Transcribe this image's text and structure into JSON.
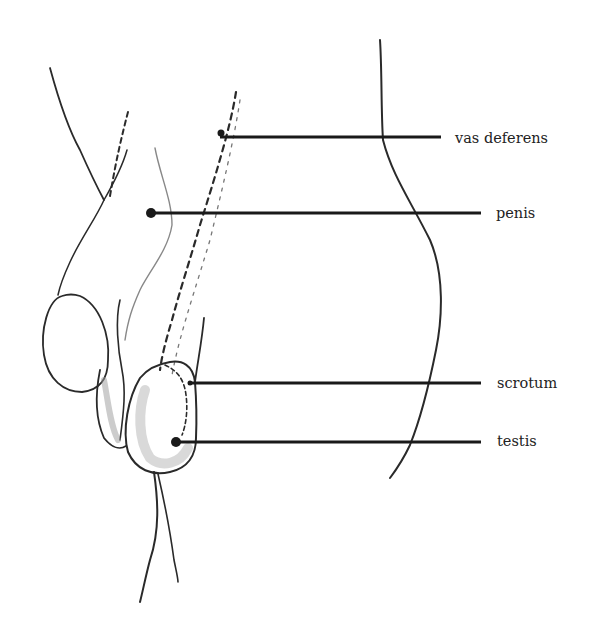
{
  "diagram": {
    "type": "anatomical-illustration",
    "colors": {
      "ink": "#222222",
      "background": "#ffffff",
      "shading": "#bdbdbd"
    },
    "labels": [
      {
        "id": "vas-deferens",
        "text": "vas deferens",
        "x": 455,
        "y": 131
      },
      {
        "id": "penis",
        "text": "penis",
        "x": 496,
        "y": 206
      },
      {
        "id": "scrotum",
        "text": "scrotum",
        "x": 497,
        "y": 376
      },
      {
        "id": "testis",
        "text": "testis",
        "x": 497,
        "y": 434
      }
    ],
    "leaders": [
      {
        "id": "vas-deferens",
        "x1": 220,
        "x2": 441,
        "y": 137
      },
      {
        "id": "penis",
        "x1": 150,
        "x2": 481,
        "y": 213
      },
      {
        "id": "scrotum",
        "x1": 190,
        "x2": 481,
        "y": 383
      },
      {
        "id": "testis",
        "x1": 176,
        "x2": 481,
        "y": 442
      }
    ]
  }
}
